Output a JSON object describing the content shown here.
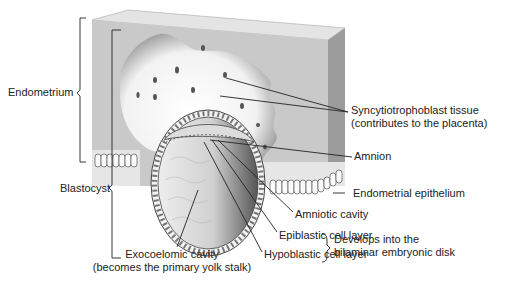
{
  "diagram": {
    "labels": {
      "endometrium": "Endometrium",
      "blastocyst": "Blastocyst",
      "syncytio_line1": "Syncytiotrophoblast tissue",
      "syncytio_line2": "(contributes to the placenta)",
      "amnion": "Amnion",
      "endometrial_epithelium": "Endometrial epithelium",
      "amniotic_cavity": "Amniotic cavity",
      "epiblastic": "Epiblastic cell layer",
      "hypoblastic": "Hypoblastic cell layer",
      "develops_line1": "Develops into the",
      "develops_line2": "bilaminar embryonic disk",
      "exocoelomic_line1": "Exocoelomic cavity",
      "exocoelomic_line2": "(becomes the primary yolk stalk)"
    },
    "colors": {
      "tissue_face": "#c8c8c8",
      "tissue_side": "#9e9e9e",
      "tissue_top": "#e2e2e2",
      "cavity": "#ffffff",
      "line": "#222222"
    }
  }
}
